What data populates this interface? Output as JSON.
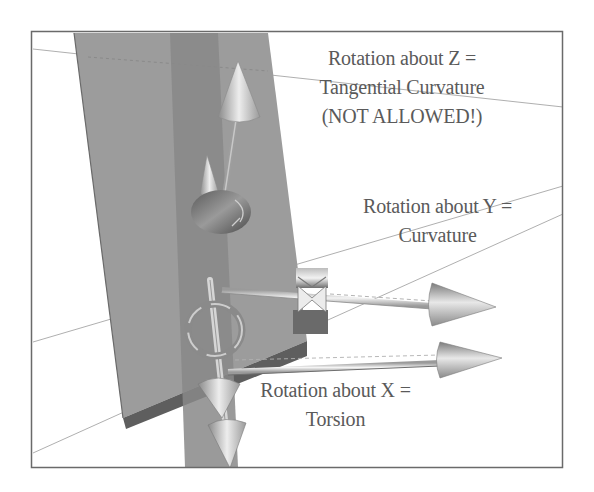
{
  "figure": {
    "labels": {
      "z": {
        "line1": "Rotation about Z =",
        "line2": "Tangential Curvature",
        "line3": "(NOT ALLOWED!)"
      },
      "y": {
        "line1": "Rotation about Y =",
        "line2": "Curvature"
      },
      "x": {
        "line1": "Rotation about X =",
        "line2": "Torsion"
      }
    },
    "colors": {
      "background": "#ffffff",
      "frame": "#6a6a6a",
      "ribbon_plane": "#9c9c9c",
      "ribbon_edge": "#5e5e5e",
      "tangent_strip": "#8a8a8a",
      "arrow_light": "#e4e4e4",
      "arrow_dark": "#7a7a7a",
      "guide_line": "#a0a0a0",
      "text": "#5a5a5a"
    },
    "elements": {
      "axes": [
        "z-axis-arrow",
        "y-axis-arrow",
        "x-axis-arrow",
        "secondary-y-arrow"
      ],
      "rotation_rings": [
        "z-rotation-ring",
        "y-rotation-ring",
        "x-rotation-ring"
      ]
    }
  }
}
